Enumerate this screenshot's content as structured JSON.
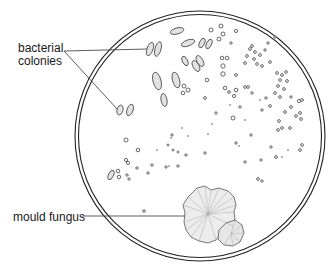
{
  "diagram": {
    "type": "petri-dish-illustration",
    "labels": {
      "bacterial_colonies_line1": "bacterial",
      "bacterial_colonies_line2": "colonies",
      "mould_fungus": "mould fungus"
    },
    "dish": {
      "cx": 200,
      "cy": 136,
      "r_outer": 125,
      "r_inner": 121,
      "stroke": "#222222"
    },
    "mould": {
      "fill": "#e9e9e9",
      "stroke": "#555555"
    },
    "colony_stroke": "#444444",
    "colony_fill": "#dcdcdc"
  }
}
